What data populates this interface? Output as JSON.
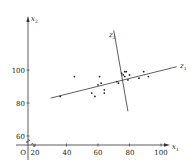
{
  "chart_data": {
    "type": "scatter",
    "title": "",
    "xlabel": "x1",
    "ylabel": "x2",
    "origin_label": "O",
    "x_ticks": [
      20,
      40,
      60,
      80,
      100
    ],
    "y_ticks": [
      60,
      80,
      100
    ],
    "xlim": [
      14,
      112
    ],
    "ylim": [
      54,
      146
    ],
    "grid": false,
    "legend": null,
    "rotated_axes": [
      {
        "name": "z1",
        "label": "z1",
        "from": [
          30,
          83
        ],
        "to": [
          110,
          102
        ]
      },
      {
        "name": "z2",
        "label": "z2",
        "from": [
          70,
          124
        ],
        "to": [
          79,
          75
        ]
      }
    ],
    "points": [
      {
        "x": 36,
        "y": 84
      },
      {
        "x": 45,
        "y": 96
      },
      {
        "x": 56,
        "y": 86
      },
      {
        "x": 58,
        "y": 84
      },
      {
        "x": 60,
        "y": 91
      },
      {
        "x": 61,
        "y": 96
      },
      {
        "x": 62,
        "y": 92
      },
      {
        "x": 64,
        "y": 88
      },
      {
        "x": 64,
        "y": 86
      },
      {
        "x": 72,
        "y": 93
      },
      {
        "x": 73,
        "y": 92
      },
      {
        "x": 75,
        "y": 98
      },
      {
        "x": 76,
        "y": 97
      },
      {
        "x": 77,
        "y": 99
      },
      {
        "x": 77,
        "y": 96
      },
      {
        "x": 78,
        "y": 99
      },
      {
        "x": 79,
        "y": 94
      },
      {
        "x": 80,
        "y": 97
      },
      {
        "x": 86,
        "y": 95
      },
      {
        "x": 89,
        "y": 99
      },
      {
        "x": 92,
        "y": 96
      }
    ]
  },
  "labels": {
    "x_axis": "x",
    "x_axis_sub": "1",
    "y_axis": "x",
    "y_axis_sub": "2",
    "z1": "z",
    "z1_sub": "1",
    "z2": "z",
    "z2_sub": "2",
    "origin": "O",
    "xt0": "20",
    "xt1": "40",
    "xt2": "60",
    "xt3": "80",
    "xt4": "100",
    "yt0": "60",
    "yt1": "80",
    "yt2": "100"
  }
}
